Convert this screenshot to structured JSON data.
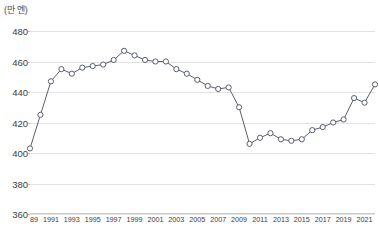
{
  "chart_data": {
    "type": "line",
    "title": "",
    "subtitle": "",
    "xlabel": "",
    "ylabel": "",
    "unit_label": "(만 엔)",
    "ylim": [
      360,
      480
    ],
    "ytick_step": 20,
    "yticks": [
      480,
      460,
      440,
      420,
      400,
      380,
      360
    ],
    "grid": true,
    "legend": false,
    "xlim": [
      1989,
      2022
    ],
    "xtick_labels": [
      "1989",
      "1991",
      "1993",
      "1995",
      "1997",
      "1999",
      "2001",
      "2003",
      "2005",
      "2007",
      "2009",
      "2011",
      "2013",
      "2015",
      "2017",
      "2019",
      "2021"
    ],
    "x": [
      1989,
      1990,
      1991,
      1992,
      1993,
      1994,
      1995,
      1996,
      1997,
      1998,
      1999,
      2000,
      2001,
      2002,
      2003,
      2004,
      2005,
      2006,
      2007,
      2008,
      2009,
      2010,
      2011,
      2012,
      2013,
      2014,
      2015,
      2016,
      2017,
      2018,
      2019,
      2020,
      2021,
      2022
    ],
    "series": [
      {
        "name": "평균 급여",
        "color": "#5a5f6e",
        "marker": "circle-open",
        "values": [
          403,
          425,
          447,
          455,
          452,
          456,
          457,
          458,
          461,
          467,
          464,
          461,
          460,
          460,
          455,
          452,
          448,
          444,
          442,
          443,
          430,
          406,
          410,
          413,
          409,
          408,
          409,
          415,
          417,
          420,
          422,
          436,
          433,
          445
        ]
      }
    ]
  }
}
